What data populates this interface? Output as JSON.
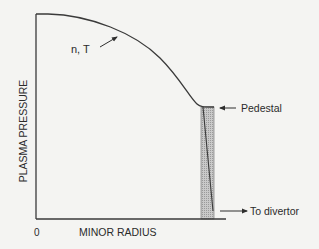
{
  "diagram": {
    "axes": {
      "y_label": "PLASMA PRESSURE",
      "x_label": "MINOR RADIUS",
      "origin_label": "0"
    },
    "annotations": {
      "profile_label": "n, T",
      "pedestal_label": "Pedestal",
      "divertor_label": "To divertor"
    },
    "colors": {
      "background": "#f4f4f2",
      "line": "#3a3a3a",
      "pedestal_fill": "#b8b8b8",
      "text": "#2b2b2b"
    }
  }
}
